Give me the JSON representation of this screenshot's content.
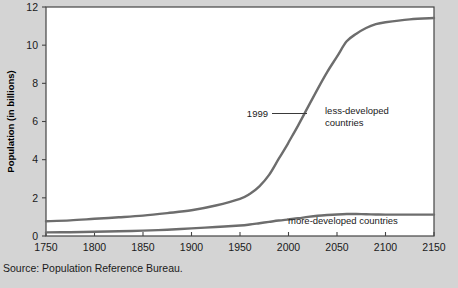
{
  "source_note": "Source: Population Reference Bureau.",
  "colors": {
    "background": "#d4d4d4",
    "plot_background": "#ffffff",
    "axis": "#444444",
    "curve": "#6d6d6d",
    "text": "#1a1a1a"
  },
  "annotations": {
    "year_marker": "1999",
    "less_developed_line1": "less-developed",
    "less_developed_line2": "countries",
    "more_developed": "more-developed countries"
  },
  "chart_data": {
    "type": "line",
    "title": "",
    "xlabel": "",
    "ylabel": "Population (in billions)",
    "xlim": [
      1750,
      2150
    ],
    "ylim": [
      0,
      12
    ],
    "xticks": [
      1750,
      1800,
      1850,
      1900,
      1950,
      2000,
      2050,
      2100,
      2150
    ],
    "yticks": [
      0,
      2,
      4,
      6,
      8,
      10,
      12
    ],
    "grid": false,
    "legend": "inline-annotations",
    "x": [
      1750,
      1775,
      1800,
      1825,
      1850,
      1875,
      1900,
      1925,
      1950,
      1960,
      1970,
      1980,
      1990,
      1999,
      2000,
      2010,
      2020,
      2030,
      2040,
      2050,
      2060,
      2070,
      2080,
      2090,
      2100,
      2125,
      2150
    ],
    "series": [
      {
        "name": "less-developed countries",
        "values": [
          0.77,
          0.82,
          0.9,
          0.98,
          1.07,
          1.2,
          1.35,
          1.6,
          1.95,
          2.2,
          2.6,
          3.2,
          4.05,
          4.8,
          4.9,
          5.8,
          6.75,
          7.7,
          8.6,
          9.4,
          10.2,
          10.6,
          10.9,
          11.1,
          11.2,
          11.35,
          11.42
        ]
      },
      {
        "name": "more-developed countries",
        "values": [
          0.19,
          0.2,
          0.22,
          0.25,
          0.28,
          0.33,
          0.4,
          0.47,
          0.55,
          0.6,
          0.67,
          0.74,
          0.81,
          0.86,
          0.87,
          0.93,
          1.0,
          1.06,
          1.1,
          1.13,
          1.15,
          1.15,
          1.14,
          1.13,
          1.12,
          1.12,
          1.12
        ]
      }
    ],
    "annotations": [
      {
        "label": "1999",
        "x": 1999,
        "y": 6.2,
        "kind": "leader-line"
      },
      {
        "label": "less-developed countries",
        "x": 2030,
        "y": 6.4,
        "kind": "series-label"
      },
      {
        "label": "more-developed countries",
        "x": 2040,
        "y": 1.0,
        "kind": "series-label"
      }
    ]
  }
}
